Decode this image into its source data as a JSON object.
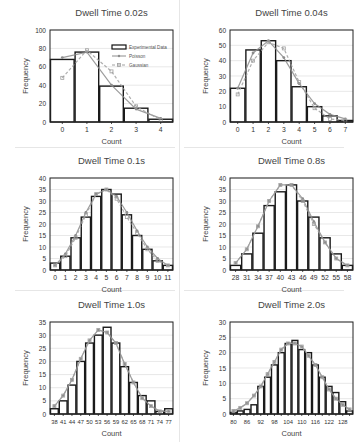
{
  "legend": {
    "experimental": "Experimental Data",
    "poisson": "Poisson",
    "gaussian": "Gaussian"
  },
  "colors": {
    "bar_stroke": "#1a1a1a",
    "bar_fill": "#ffffff",
    "poisson": "#8c8c8c",
    "gaussian": "#a0a0a0",
    "grid": "#d9d9d9",
    "text": "#444444"
  },
  "chart_data": [
    {
      "type": "bar",
      "title": "Dwell Time 0.02s",
      "xlabel": "Count",
      "ylabel": "Frequency",
      "ylim": [
        0,
        100
      ],
      "yticks": [
        0,
        20,
        40,
        60,
        80,
        100
      ],
      "categories": [
        "0",
        "1",
        "2",
        "3",
        "4"
      ],
      "tick_labels": [
        "0",
        "1",
        "2",
        "3",
        "4"
      ],
      "series": [
        {
          "name": "Experimental Data",
          "values": [
            68,
            76,
            39,
            15,
            3
          ]
        },
        {
          "name": "Poisson",
          "values": [
            70,
            76,
            40,
            14,
            4
          ]
        },
        {
          "name": "Gaussian",
          "values": [
            48,
            78,
            55,
            17,
            2
          ]
        }
      ],
      "legend": true,
      "grid": true
    },
    {
      "type": "bar",
      "title": "Dwell Time 0.04s",
      "xlabel": "Count",
      "ylabel": "Frequency",
      "ylim": [
        0,
        60
      ],
      "yticks": [
        0,
        10,
        20,
        30,
        40,
        50,
        60
      ],
      "categories": [
        "0",
        "1",
        "2",
        "3",
        "4",
        "5",
        "6",
        "7"
      ],
      "tick_labels": [
        "0",
        "1",
        "2",
        "3",
        "4",
        "5",
        "6",
        "7"
      ],
      "series": [
        {
          "name": "Experimental Data",
          "values": [
            22,
            47,
            53,
            40,
            23,
            10,
            4,
            1
          ]
        },
        {
          "name": "Poisson",
          "values": [
            22,
            45,
            53,
            42,
            25,
            12,
            5,
            2
          ]
        },
        {
          "name": "Gaussian",
          "values": [
            18,
            40,
            52,
            48,
            26,
            9,
            2,
            1
          ]
        }
      ],
      "legend": false,
      "grid": true
    },
    {
      "type": "bar",
      "title": "Dwell Time 0.1s",
      "xlabel": "Count",
      "ylabel": "Frequency",
      "ylim": [
        0,
        40
      ],
      "yticks": [
        0,
        5,
        10,
        15,
        20,
        25,
        30,
        35,
        40
      ],
      "categories": [
        "0",
        "1",
        "2",
        "3",
        "4",
        "5",
        "6",
        "7",
        "8",
        "9",
        "10",
        "11"
      ],
      "tick_labels": [
        "0",
        "1",
        "2",
        "3",
        "4",
        "5",
        "6",
        "7",
        "8",
        "9",
        "10",
        "11"
      ],
      "series": [
        {
          "name": "Experimental Data",
          "values": [
            3,
            6,
            14,
            23,
            32,
            35,
            33,
            24,
            15,
            9,
            4,
            2
          ]
        },
        {
          "name": "Poisson",
          "values": [
            2,
            7,
            15,
            25,
            33,
            35,
            32,
            25,
            17,
            10,
            5,
            2
          ]
        },
        {
          "name": "Gaussian",
          "values": [
            2,
            6,
            14,
            24,
            33,
            35,
            31,
            23,
            16,
            9,
            4,
            2
          ]
        }
      ],
      "legend": false,
      "grid": true
    },
    {
      "type": "bar",
      "title": "Dwell Time 0.8s",
      "xlabel": "Count",
      "ylabel": "Frequency",
      "ylim": [
        0,
        40
      ],
      "yticks": [
        0,
        5,
        10,
        15,
        20,
        25,
        30,
        35,
        40
      ],
      "categories": [
        "28",
        "31",
        "34",
        "37",
        "40",
        "43",
        "46",
        "49",
        "52",
        "55",
        "58"
      ],
      "tick_labels": [
        "28",
        "31",
        "34",
        "37",
        "40",
        "43",
        "46",
        "49",
        "52",
        "55",
        "58"
      ],
      "series": [
        {
          "name": "Experimental Data",
          "values": [
            2,
            7,
            16,
            28,
            34,
            37,
            30,
            23,
            14,
            7,
            2
          ]
        },
        {
          "name": "Poisson",
          "values": [
            3,
            9,
            19,
            30,
            37,
            37,
            31,
            21,
            12,
            5,
            2
          ]
        },
        {
          "name": "Gaussian",
          "values": [
            3,
            9,
            19,
            30,
            37,
            37,
            30,
            20,
            12,
            5,
            2
          ]
        }
      ],
      "legend": false,
      "grid": true
    },
    {
      "type": "bar",
      "title": "Dwell Time 1.0s",
      "xlabel": "Count",
      "ylabel": "Frequency",
      "ylim": [
        0,
        35
      ],
      "yticks": [
        0,
        5,
        10,
        15,
        20,
        25,
        30,
        35
      ],
      "categories": [
        "38",
        "41",
        "44",
        "47",
        "50",
        "53",
        "56",
        "59",
        "62",
        "65",
        "68",
        "71",
        "74",
        "77"
      ],
      "tick_labels": [
        "38",
        "41",
        "44",
        "47",
        "50",
        "53",
        "56",
        "59",
        "62",
        "65",
        "68",
        "71",
        "74",
        "77"
      ],
      "series": [
        {
          "name": "Experimental Data",
          "values": [
            2,
            5,
            11,
            20,
            27,
            30,
            33,
            27,
            18,
            12,
            7,
            5,
            1,
            2
          ]
        },
        {
          "name": "Poisson",
          "values": [
            3,
            7,
            13,
            21,
            28,
            32,
            31,
            27,
            19,
            12,
            6,
            3,
            1,
            1
          ]
        },
        {
          "name": "Gaussian",
          "values": [
            3,
            7,
            13,
            21,
            28,
            32,
            31,
            27,
            19,
            12,
            6,
            3,
            1,
            1
          ]
        }
      ],
      "legend": false,
      "grid": true
    },
    {
      "type": "bar",
      "title": "Dwell Time 2.0s",
      "xlabel": "Count",
      "ylabel": "Frequency",
      "ylim": [
        0,
        30
      ],
      "yticks": [
        0,
        5,
        10,
        15,
        20,
        25,
        30
      ],
      "categories": [
        "80",
        "83",
        "86",
        "89",
        "92",
        "95",
        "98",
        "101",
        "104",
        "107",
        "110",
        "113",
        "116",
        "119",
        "122",
        "125",
        "128",
        "131"
      ],
      "tick_labels": [
        "80",
        "",
        "86",
        "",
        "92",
        "",
        "98",
        "",
        "104",
        "",
        "110",
        "",
        "116",
        "",
        "122",
        "",
        "128",
        ""
      ],
      "series": [
        {
          "name": "Experimental Data",
          "values": [
            0.5,
            1,
            1.5,
            3,
            9,
            12,
            16,
            20,
            23,
            24,
            21,
            20,
            16,
            12,
            9,
            7,
            4,
            1
          ]
        },
        {
          "name": "Poisson",
          "values": [
            1,
            2,
            3.5,
            6,
            9,
            13,
            17,
            21,
            23,
            23,
            22,
            19,
            16,
            12,
            8,
            5,
            3,
            1.5
          ]
        },
        {
          "name": "Gaussian",
          "values": [
            1,
            2,
            3.5,
            6,
            9,
            13,
            17,
            21,
            23,
            23,
            22,
            19,
            16,
            12,
            8,
            5,
            3,
            1.5
          ]
        }
      ],
      "legend": false,
      "grid": true
    }
  ]
}
